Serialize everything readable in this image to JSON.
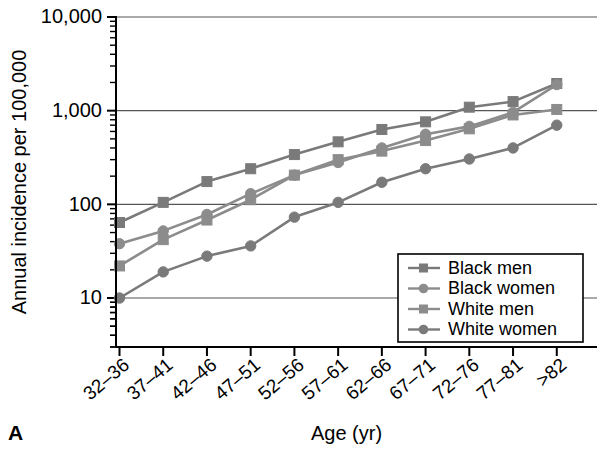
{
  "panel": {
    "label": "A"
  },
  "chart_data": {
    "type": "line",
    "title": "",
    "xlabel": "Age (yr)",
    "ylabel": "Annual incidence per 100,000",
    "yscale": "log",
    "ylim": [
      3,
      10000
    ],
    "ytick_labels": [
      "10",
      "100",
      "1,000",
      "10,000"
    ],
    "ytick_values": [
      10,
      100,
      1000,
      10000
    ],
    "grid": "horizontal",
    "legend_position": "bottom-right",
    "categories": [
      "32–36",
      "37–41",
      "42–46",
      "47–51",
      "52–56",
      "57–61",
      "62–66",
      "67–71",
      "72–76",
      "77–81",
      ">82"
    ],
    "series": [
      {
        "name": "Black men",
        "marker": "square",
        "color": "#7a7a7a",
        "values": [
          64,
          105,
          175,
          240,
          340,
          465,
          630,
          760,
          1090,
          1250,
          1950
        ]
      },
      {
        "name": "Black women",
        "marker": "circle",
        "color": "#8c8c8c",
        "values": [
          38,
          52,
          78,
          130,
          205,
          280,
          400,
          560,
          680,
          960,
          1900
        ]
      },
      {
        "name": "White men",
        "marker": "square",
        "color": "#8c8c8c",
        "values": [
          22,
          42,
          68,
          112,
          205,
          300,
          370,
          480,
          640,
          900,
          1030
        ]
      },
      {
        "name": "White women",
        "marker": "circle",
        "color": "#7a7a7a",
        "values": [
          10,
          19,
          28,
          36,
          73,
          105,
          172,
          240,
          305,
          400,
          700
        ]
      }
    ]
  },
  "axes": {
    "y_tick_label_10000": "10,000",
    "y_tick_label_1000": "1,000",
    "y_tick_label_100": "100",
    "y_tick_label_10": "10"
  }
}
